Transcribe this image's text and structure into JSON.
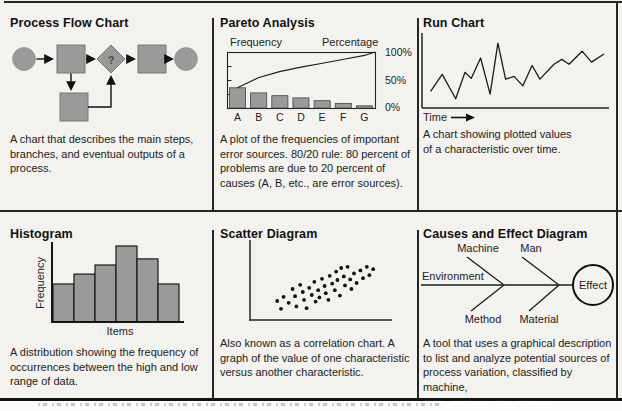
{
  "figure": {
    "background": "#f3f2ef",
    "shape_gray": "#9a9a9a",
    "ink": "#1c1c1c"
  },
  "cells": {
    "process_flow": {
      "title": "Process Flow Chart",
      "decision_label": "?",
      "description": "A chart that describes the main steps,\nbranches, and eventual outputs of a\nprocess."
    },
    "pareto": {
      "title": "Pareto Analysis",
      "left_axis_label": "Frequency",
      "right_axis_label": "Percentage",
      "right_ticks": [
        "100%",
        "50%",
        "0%"
      ],
      "description": "A plot of the frequencies of important\nerror sources. 80/20 rule: 80 percent of\nproblems are due to 20 percent of\ncauses (A, B, etc., are error sources)."
    },
    "run": {
      "title": "Run Chart",
      "x_axis_label": "Time",
      "description": "A  chart showing plotted values\nof a characteristic over time."
    },
    "histogram": {
      "title": "Histogram",
      "y_axis_label": "Frequency",
      "x_axis_label": "Items",
      "description": "A distribution showing the frequency of\noccurrences between the high and low\nrange of data."
    },
    "scatter": {
      "title": "Scatter Diagram",
      "description": "Also known as a correlation chart. A\ngraph of the value of one characteristic\nversus another characteristic."
    },
    "fishbone": {
      "title": "Causes and Effect Diagram",
      "bone_top_1": "Machine",
      "bone_top_2": "Man",
      "spine_label": "Environment",
      "bone_bottom_1": "Method",
      "bone_bottom_2": "Material",
      "effect_label": "Effect",
      "description": "A tool that uses a graphical description\nto list and analyze potential sources of\nprocess variation, classified by machine,\nman, method, and material."
    }
  },
  "chart_data": [
    {
      "id": "pareto",
      "type": "bar",
      "title": "Pareto Analysis",
      "categories": [
        "A",
        "B",
        "C",
        "D",
        "E",
        "F",
        "G"
      ],
      "values": [
        0.36,
        0.27,
        0.22,
        0.18,
        0.13,
        0.08,
        0.04
      ],
      "value_units": "fraction of plot height (frequency axis unlabeled)",
      "cumulative_percentage_line": [
        [
          0.07,
          0.36
        ],
        [
          0.21,
          0.54
        ],
        [
          0.355,
          0.65
        ],
        [
          0.5,
          0.73
        ],
        [
          0.645,
          0.8
        ],
        [
          0.79,
          0.87
        ],
        [
          0.93,
          0.94
        ],
        [
          1.0,
          1.0
        ]
      ],
      "left_axis_label": "Frequency",
      "right_axis_label": "Percentage",
      "right_axis_ticks": [
        "100%",
        "50%",
        "0%"
      ],
      "legend": "none",
      "grid": "off"
    },
    {
      "id": "run",
      "type": "line",
      "title": "Run Chart",
      "xlabel": "Time",
      "points": [
        [
          0.026,
          0.23
        ],
        [
          0.091,
          0.48
        ],
        [
          0.167,
          0.12
        ],
        [
          0.219,
          0.51
        ],
        [
          0.254,
          0.42
        ],
        [
          0.307,
          0.72
        ],
        [
          0.36,
          0.19
        ],
        [
          0.404,
          0.94
        ],
        [
          0.447,
          0.41
        ],
        [
          0.495,
          0.45
        ],
        [
          0.544,
          0.31
        ],
        [
          0.596,
          0.61
        ],
        [
          0.64,
          0.41
        ],
        [
          0.719,
          0.63
        ],
        [
          0.763,
          0.7
        ],
        [
          0.804,
          0.63
        ],
        [
          0.877,
          0.82
        ],
        [
          0.93,
          0.66
        ],
        [
          1.0,
          0.78
        ]
      ],
      "grid": "off"
    },
    {
      "id": "histogram",
      "type": "bar",
      "title": "Histogram",
      "xlabel": "Items",
      "ylabel": "Frequency",
      "values": [
        0.5,
        0.63,
        0.75,
        1.0,
        0.83,
        0.5
      ],
      "value_units": "fraction of tallest bar (axes unlabeled)",
      "grid": "off"
    },
    {
      "id": "scatter",
      "type": "scatter",
      "title": "Scatter Diagram",
      "points": [
        [
          0.15,
          0.25
        ],
        [
          0.18,
          0.12
        ],
        [
          0.2,
          0.32
        ],
        [
          0.24,
          0.22
        ],
        [
          0.27,
          0.45
        ],
        [
          0.29,
          0.33
        ],
        [
          0.3,
          0.16
        ],
        [
          0.33,
          0.52
        ],
        [
          0.35,
          0.4
        ],
        [
          0.36,
          0.27
        ],
        [
          0.38,
          0.13
        ],
        [
          0.4,
          0.47
        ],
        [
          0.42,
          0.35
        ],
        [
          0.44,
          0.57
        ],
        [
          0.45,
          0.24
        ],
        [
          0.47,
          0.43
        ],
        [
          0.48,
          0.31
        ],
        [
          0.5,
          0.62
        ],
        [
          0.52,
          0.5
        ],
        [
          0.53,
          0.38
        ],
        [
          0.55,
          0.27
        ],
        [
          0.56,
          0.67
        ],
        [
          0.58,
          0.54
        ],
        [
          0.6,
          0.43
        ],
        [
          0.61,
          0.74
        ],
        [
          0.62,
          0.6
        ],
        [
          0.64,
          0.34
        ],
        [
          0.65,
          0.8
        ],
        [
          0.67,
          0.66
        ],
        [
          0.68,
          0.51
        ],
        [
          0.7,
          0.82
        ],
        [
          0.72,
          0.61
        ],
        [
          0.73,
          0.45
        ],
        [
          0.75,
          0.71
        ],
        [
          0.77,
          0.55
        ],
        [
          0.8,
          0.76
        ],
        [
          0.82,
          0.63
        ],
        [
          0.85,
          0.82
        ],
        [
          0.87,
          0.68
        ],
        [
          0.9,
          0.78
        ]
      ],
      "grid": "off"
    }
  ]
}
